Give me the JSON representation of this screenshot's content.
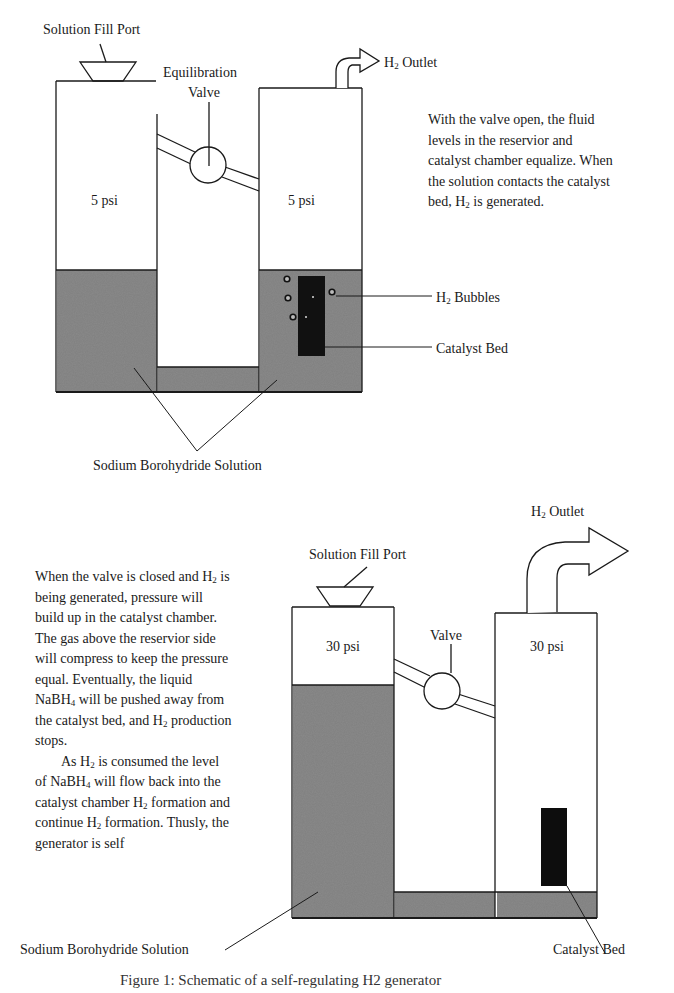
{
  "colors": {
    "solution_fill": "#8a8a8a",
    "catalyst_fill": "#111111",
    "outline": "#1a1a1a",
    "background": "#ffffff"
  },
  "top_diagram": {
    "fill_port_label": "Solution Fill Port",
    "valve_label_line1": "Equilibration",
    "valve_label_line2": "Valve",
    "outlet_label_prefix": "H",
    "outlet_label_sub": "2",
    "outlet_label_suffix": " Outlet",
    "reservoir_pressure": "5 psi",
    "catalyst_chamber_pressure": "5 psi",
    "bubbles_label_prefix": "H",
    "bubbles_label_sub": "2",
    "bubbles_label_suffix": " Bubbles",
    "catalyst_bed_label": "Catalyst Bed",
    "solution_label": "Sodium Borohydride Solution",
    "description": {
      "part1": "With the valve open, the fluid levels in the reservior and catalyst chamber equalize.  When the solution contacts the catalyst bed, H",
      "sub": "2",
      "part2": " is generated."
    }
  },
  "bottom_diagram": {
    "fill_port_label": "Solution Fill Port",
    "valve_label": "Valve",
    "outlet_label_prefix": "H",
    "outlet_label_sub": "2",
    "outlet_label_suffix": " Outlet",
    "reservoir_pressure": "30 psi",
    "catalyst_chamber_pressure": "30 psi",
    "catalyst_bed_label": "Catalyst Bed",
    "solution_label": "Sodium Borohydride Solution",
    "description": {
      "p1_a": "When the valve is closed and H",
      "p1_sub1": "2",
      "p1_b": " is being generated, pressure will build up in the catalyst chamber.  The gas above the reservior side will compress to keep the pressure equal.  Eventually, the liquid NaBH",
      "p1_sub2": "4",
      "p1_c": " will be pushed away from the catalyst bed, and H",
      "p1_sub3": "2",
      "p1_d": " production stops.",
      "p2_a": "As H",
      "p2_sub1": "2",
      "p2_b": " is consumed the level of NaBH",
      "p2_sub2": "4",
      "p2_c": " will flow back into the catalyst chamber H",
      "p2_sub3": "2",
      "p2_d": " formation and continue H",
      "p2_sub4": "2",
      "p2_e": " formation. Thusly, the generator is self"
    }
  },
  "caption": "Figure 1: Schematic of a self-regulating H2 generator"
}
